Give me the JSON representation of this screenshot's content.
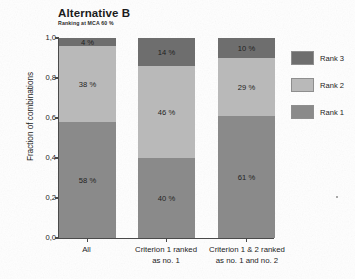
{
  "chart_data": {
    "type": "bar",
    "variant": "stacked-100-percent",
    "title": "Alternative B",
    "subtitle": "Ranking at MCA 60 %",
    "xlabel": "",
    "ylabel": "Fraction of combinations",
    "ylim": [
      0,
      1
    ],
    "ytick_labels": [
      "0,0",
      "0,2",
      "0,4",
      "0,6",
      "0,8",
      "1,0"
    ],
    "ytick_values": [
      0,
      0.2,
      0.4,
      0.6,
      0.8,
      1.0
    ],
    "grid": false,
    "legend_position": "right",
    "categories": [
      "All",
      "Criterion 1 ranked as no. 1",
      "Criterion 1 & 2 ranked as no. 1 and no. 2"
    ],
    "category_lines": [
      [
        "All"
      ],
      [
        "Criterion 1 ranked",
        "as no. 1"
      ],
      [
        "Criterion 1 & 2 ranked",
        "as no. 1 and no. 2"
      ]
    ],
    "series": [
      {
        "name": "Rank 1",
        "color": "#8a8a8a",
        "values": [
          0.58,
          0.4,
          0.61
        ],
        "labels": [
          "58 %",
          "40 %",
          "61 %"
        ]
      },
      {
        "name": "Rank 2",
        "color": "#b9b9b9",
        "values": [
          0.38,
          0.46,
          0.29
        ],
        "labels": [
          "38 %",
          "46 %",
          "29 %"
        ]
      },
      {
        "name": "Rank 3",
        "color": "#6e6e6e",
        "values": [
          0.04,
          0.14,
          0.1
        ],
        "labels": [
          "4 %",
          "14 %",
          "10 %"
        ]
      }
    ],
    "legend_entries": [
      {
        "label": "Rank 3",
        "color": "#6e6e6e"
      },
      {
        "label": "Rank 2",
        "color": "#b9b9b9"
      },
      {
        "label": "Rank 1",
        "color": "#8a8a8a"
      }
    ]
  }
}
